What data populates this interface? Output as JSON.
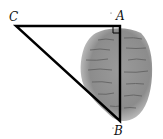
{
  "diagram": {
    "type": "geometry",
    "points": {
      "C": {
        "label": "C",
        "x": 16,
        "y": 26
      },
      "A": {
        "label": "A",
        "x": 120,
        "y": 26
      },
      "B": {
        "label": "B",
        "x": 120,
        "y": 121
      }
    },
    "right_angle_at": "A",
    "shaded_region": "pond",
    "colors": {
      "line": "#000000",
      "pond_fill": "#8a8a8a",
      "pond_stroke_marks": "#5a5a5a"
    }
  }
}
